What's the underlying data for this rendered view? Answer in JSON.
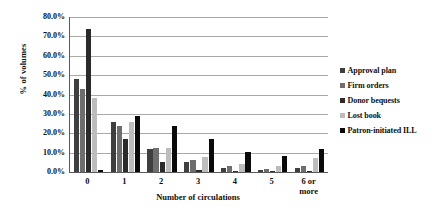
{
  "chart_data": {
    "type": "bar",
    "title": "",
    "xlabel": "Number of circulations",
    "ylabel": "% of volumes",
    "categories": [
      "0",
      "1",
      "2",
      "3",
      "4",
      "5",
      "6 or more"
    ],
    "ylim": [
      0,
      80
    ],
    "ytick_labels": [
      "0.0%",
      "10.0%",
      "20.0%",
      "30.0%",
      "40.0%",
      "50.0%",
      "60.0%",
      "70.0%",
      "80.0%"
    ],
    "ytick_values": [
      0,
      10,
      20,
      30,
      40,
      50,
      60,
      70,
      80
    ],
    "grid": true,
    "legend_position": "right",
    "series": [
      {
        "name": "Approval plan",
        "color": "#3f3f3f",
        "values": [
          48.0,
          26.0,
          12.0,
          5.0,
          2.0,
          1.0,
          2.0
        ]
      },
      {
        "name": "Firm orders",
        "color": "#6e6e6e",
        "values": [
          43.0,
          24.0,
          12.5,
          6.0,
          3.0,
          1.5,
          3.0
        ]
      },
      {
        "name": "Donor bequests",
        "color": "#2b2b2b",
        "values": [
          74.0,
          17.0,
          5.0,
          1.0,
          0.5,
          0.3,
          0.3
        ]
      },
      {
        "name": "Lost book",
        "color": "#bdbdbd",
        "values": [
          38.0,
          26.0,
          12.5,
          7.5,
          4.0,
          3.0,
          7.0
        ]
      },
      {
        "name": "Patron-initiated ILL",
        "color": "#0a0a0a",
        "values": [
          1.0,
          29.0,
          24.0,
          17.0,
          10.5,
          8.5,
          12.0
        ]
      }
    ]
  }
}
